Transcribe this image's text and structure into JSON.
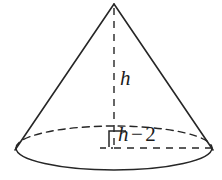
{
  "figure": {
    "name": "cone-diagram",
    "shape": "cone",
    "background_color": "#ffffff",
    "stroke_color": "#262626",
    "labels": {
      "height": "h",
      "radius_variable": "h",
      "radius_operator": "−",
      "radius_value": "2",
      "radius_full": "h − 2"
    },
    "geometry": {
      "apex_x": 114,
      "apex_y": 4,
      "base_center_x": 114,
      "base_center_y": 148,
      "base_radius_x": 98,
      "base_radius_y": 22,
      "height_px": 144,
      "right_angle_marker": true
    }
  }
}
